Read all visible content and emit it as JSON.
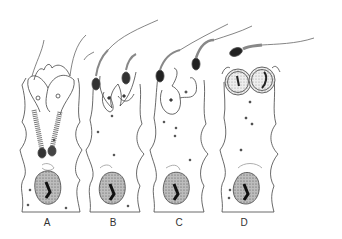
{
  "figure": {
    "type": "scientific line drawing",
    "panels": [
      {
        "label": "A",
        "x": 47
      },
      {
        "label": "B",
        "x": 113
      },
      {
        "label": "C",
        "x": 178
      },
      {
        "label": "D",
        "x": 245
      }
    ]
  }
}
